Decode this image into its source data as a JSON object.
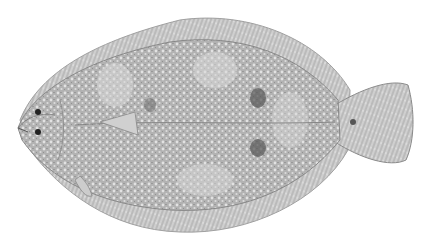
{
  "image": {
    "subject": "flatfish illustration",
    "description": "Grayscale scientific illustration of a flounder viewed from the eyed side, facing left, with mottled speckled pattern and dark blotches",
    "colors": {
      "background": "#ffffff",
      "body": "#b4b4b4",
      "body_light": "#d2d2d2",
      "fin": "#c4c4c4",
      "blotch": "#555555",
      "outline": "#8a8a8a"
    }
  }
}
